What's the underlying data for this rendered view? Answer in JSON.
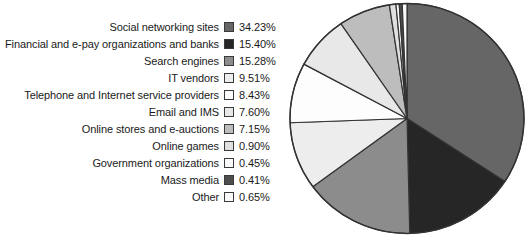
{
  "chart_data": {
    "type": "pie",
    "title": "",
    "legend_position": "left",
    "start_angle_deg": 0,
    "direction": "clockwise",
    "categories": [
      "Social networking sites",
      "Financial and e-pay organizations and banks",
      "Search engines",
      "IT vendors",
      "Telephone and Internet service providers",
      "Email and IMS",
      "Online stores and e-auctions",
      "Online games",
      "Government organizations",
      "Mass media",
      "Other"
    ],
    "values": [
      34.23,
      15.4,
      15.28,
      9.51,
      8.43,
      7.6,
      7.15,
      0.9,
      0.45,
      0.41,
      0.65
    ],
    "value_labels": [
      "34.23%",
      "15.40%",
      "15.28%",
      "9.51%",
      "8.43%",
      "7.60%",
      "7.15%",
      "0.90%",
      "0.45%",
      "0.41%",
      "0.65%"
    ],
    "colors": [
      "#666666",
      "#262626",
      "#8c8c8c",
      "#ededed",
      "#fdfdfd",
      "#e8e8e8",
      "#bdbdbd",
      "#e0e0e0",
      "#fafafa",
      "#4d4d4d",
      "#fafafa"
    ],
    "slice_outline_color": "#333333",
    "unit": "%"
  },
  "legend": {
    "rows": [
      {
        "label": "Social networking sites",
        "value": "34.23%",
        "color": "#666666"
      },
      {
        "label": "Financial and e-pay organizations and banks",
        "value": "15.40%",
        "color": "#262626"
      },
      {
        "label": "Search engines",
        "value": "15.28%",
        "color": "#8c8c8c"
      },
      {
        "label": "IT vendors",
        "value": "9.51%",
        "color": "#ededed"
      },
      {
        "label": "Telephone and Internet service providers",
        "value": "8.43%",
        "color": "#fdfdfd"
      },
      {
        "label": "Email and IMS",
        "value": "7.60%",
        "color": "#e8e8e8"
      },
      {
        "label": "Online stores and e-auctions",
        "value": "7.15%",
        "color": "#bdbdbd"
      },
      {
        "label": "Online games",
        "value": "0.90%",
        "color": "#e0e0e0"
      },
      {
        "label": "Government organizations",
        "value": "0.45%",
        "color": "#fafafa"
      },
      {
        "label": "Mass media",
        "value": "0.41%",
        "color": "#4d4d4d"
      },
      {
        "label": "Other",
        "value": "0.65%",
        "color": "#fafafa"
      }
    ]
  }
}
